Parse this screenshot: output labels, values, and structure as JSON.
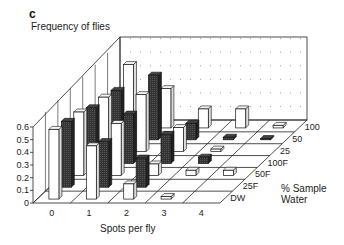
{
  "panel_letter": "c",
  "chart_data": {
    "type": "bar",
    "subtype": "3d-grouped",
    "title": "Frequency of flies",
    "xlabel": "Spots per fly",
    "zlabel_line1": "% Sample",
    "zlabel_line2": "Water",
    "ylabel": "Frequency of flies",
    "ylim": [
      0,
      0.6
    ],
    "yticks": [
      "0",
      "0.1",
      "0.2",
      "0.3",
      "0.4",
      "0.5",
      "0.6"
    ],
    "categories": [
      "0",
      "1",
      "2",
      "3",
      "4"
    ],
    "series": [
      {
        "name": "DW",
        "fill": "white",
        "values": [
          0.55,
          0.42,
          0.12,
          0.02,
          0.0
        ]
      },
      {
        "name": "25F",
        "fill": "dark",
        "values": [
          0.52,
          0.36,
          0.23,
          0.0,
          0.0
        ]
      },
      {
        "name": "50F",
        "fill": "white",
        "values": [
          0.5,
          0.41,
          0.09,
          0.04,
          0.04
        ]
      },
      {
        "name": "100F",
        "fill": "dark",
        "values": [
          0.44,
          0.39,
          0.23,
          0.05,
          0.0
        ]
      },
      {
        "name": "25",
        "fill": "white",
        "values": [
          0.43,
          0.45,
          0.19,
          0.02,
          0.0
        ]
      },
      {
        "name": "50",
        "fill": "dark",
        "values": [
          0.39,
          0.51,
          0.13,
          0.02,
          0.01
        ]
      },
      {
        "name": "100",
        "fill": "white",
        "values": [
          0.5,
          0.31,
          0.15,
          0.15,
          0.02
        ]
      }
    ],
    "grid": "dotted back wall",
    "legend": "row labels along depth axis"
  }
}
